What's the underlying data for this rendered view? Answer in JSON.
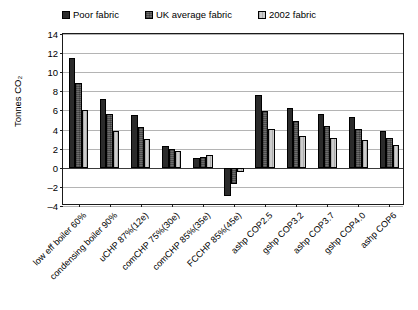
{
  "chart_data": {
    "type": "bar",
    "title": "",
    "xlabel": "",
    "ylabel": "Tonnes CO₂",
    "ylim": [
      -4,
      14
    ],
    "yticks": [
      14,
      12,
      10,
      8,
      6,
      4,
      2,
      0,
      -2,
      -4
    ],
    "grid": true,
    "legend_position": "top",
    "categories": [
      "low eff boiler 60%",
      "condensing boiler 90%",
      "uCHP 87%(12e)",
      "comCHP 75%(30e)",
      "comCHP 85%(35e)",
      "FCCHP 85%(45e)",
      "ashp COP2.5",
      "gshp COP3.2",
      "ashp COP3.7",
      "gshp COP4.0",
      "ashp COP6"
    ],
    "series": [
      {
        "name": "Poor fabric",
        "color": "#2b2b2b",
        "values": [
          11.5,
          7.2,
          5.5,
          2.3,
          1.0,
          -3.0,
          7.6,
          6.3,
          5.6,
          5.3,
          3.9
        ]
      },
      {
        "name": "UK average fabric",
        "color": "#6e6e6e",
        "values": [
          8.9,
          5.6,
          4.3,
          2.0,
          1.15,
          -1.7,
          5.9,
          4.9,
          4.4,
          4.1,
          3.1
        ]
      },
      {
        "name": "2002 fabric",
        "color": "#cdcdcd",
        "values": [
          6.0,
          3.85,
          3.0,
          1.75,
          1.3,
          -0.4,
          4.1,
          3.35,
          3.1,
          2.95,
          2.4
        ]
      }
    ]
  }
}
